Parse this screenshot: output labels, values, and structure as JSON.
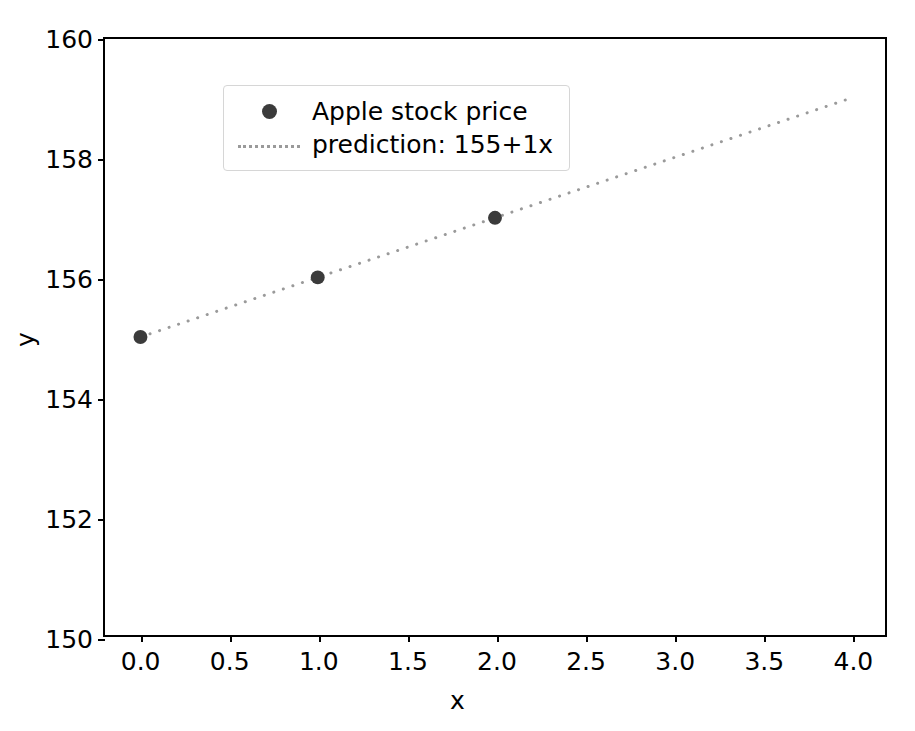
{
  "chart_data": {
    "type": "scatter",
    "title": "",
    "xlabel": "x",
    "ylabel": "y",
    "xlim": [
      -0.2,
      4.2
    ],
    "ylim": [
      150,
      160
    ],
    "grid": false,
    "legend_position": "upper left",
    "x_ticks": [
      "0.0",
      "0.5",
      "1.0",
      "1.5",
      "2.0",
      "2.5",
      "3.0",
      "3.5",
      "4.0"
    ],
    "x_tick_values": [
      0.0,
      0.5,
      1.0,
      1.5,
      2.0,
      2.5,
      3.0,
      3.5,
      4.0
    ],
    "y_ticks": [
      "150",
      "152",
      "154",
      "156",
      "158",
      "160"
    ],
    "y_tick_values": [
      150,
      152,
      154,
      156,
      158,
      160
    ],
    "series": [
      {
        "name": "Apple stock price",
        "type": "scatter",
        "marker": "circle",
        "color": "#3b3b3b",
        "marker_size": 14,
        "x": [
          0,
          1,
          2
        ],
        "y": [
          155,
          156,
          157
        ]
      },
      {
        "name": "prediction: 155+1x",
        "type": "line",
        "linestyle": "dotted",
        "color": "#9a9a9a",
        "linewidth": 3,
        "intercept": 155,
        "slope": 1,
        "x": [
          0,
          4
        ],
        "y": [
          155,
          159
        ]
      }
    ]
  },
  "legend": {
    "entries": [
      {
        "label": "Apple stock price",
        "handle": "marker-dot"
      },
      {
        "label": "prediction: 155+1x",
        "handle": "dotted-line"
      }
    ]
  },
  "colors": {
    "marker": "#3b3b3b",
    "line": "#9a9a9a",
    "spine": "#000000",
    "legend_border": "#d6d6d6",
    "background": "#ffffff"
  }
}
